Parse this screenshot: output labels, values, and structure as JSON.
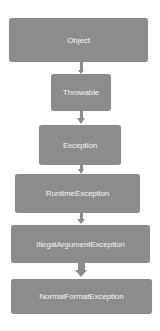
{
  "diagram": {
    "type": "class-hierarchy",
    "nodes": [
      {
        "id": "object",
        "label": "Object"
      },
      {
        "id": "throwable",
        "label": "Throwable"
      },
      {
        "id": "exception",
        "label": "Exception"
      },
      {
        "id": "runtime-exception",
        "label": "RuntimeException"
      },
      {
        "id": "illegal-argument-exception",
        "label": "IllegalArgumentException"
      },
      {
        "id": "normal-format-exception",
        "label": "NormalFormatException"
      }
    ],
    "edges": [
      {
        "from": "object",
        "to": "throwable"
      },
      {
        "from": "throwable",
        "to": "exception"
      },
      {
        "from": "exception",
        "to": "runtime-exception"
      },
      {
        "from": "runtime-exception",
        "to": "illegal-argument-exception"
      },
      {
        "from": "illegal-argument-exception",
        "to": "normal-format-exception"
      }
    ],
    "colors": {
      "node_fill": "#8c8c8c",
      "node_text": "#f4f4f4",
      "arrow": "#8c8c8c"
    }
  }
}
